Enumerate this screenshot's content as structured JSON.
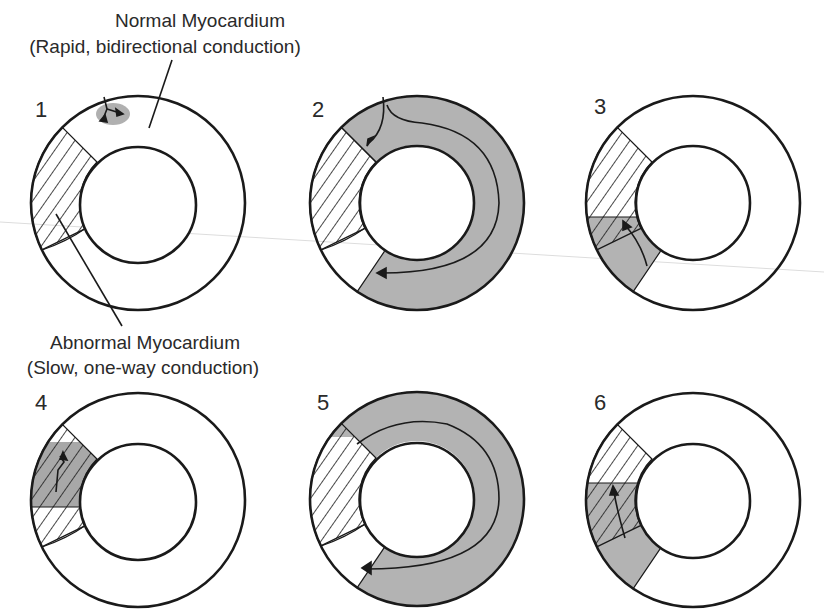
{
  "labels": {
    "normal_title": "Normal Myocardium",
    "normal_sub": "(Rapid, bidirectional conduction)",
    "abnormal_title": "Abnormal Myocardium",
    "abnormal_sub": "(Slow, one-way conduction)"
  },
  "panels": [
    {
      "number": "1",
      "state": "Impulse arrives in normal myocardium"
    },
    {
      "number": "2",
      "state": "Impulse travels around normal ring, blocked antegrade in abnormal zone"
    },
    {
      "number": "3",
      "state": "Impulse enters abnormal zone retrogradely"
    },
    {
      "number": "4",
      "state": "Slow conduction through abnormal zone"
    },
    {
      "number": "5",
      "state": "Impulse re-enters normal myocardium and circulates"
    },
    {
      "number": "6",
      "state": "Re-entry cycle repeats"
    }
  ],
  "colors": {
    "stroke": "#1a1a1a",
    "activated": "#b3b3b3",
    "activated_dark": "#9a9a9a",
    "background": "#ffffff",
    "scan_line": "#d8d8d8"
  }
}
